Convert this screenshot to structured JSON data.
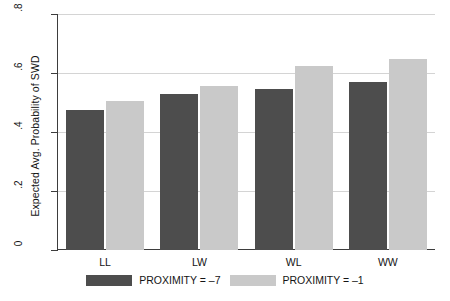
{
  "chart_data": {
    "type": "bar",
    "title": "",
    "subtitle": "",
    "xlabel": "",
    "ylabel": "Expected Avg. Probability of SWD",
    "categories": [
      "LL",
      "LW",
      "WL",
      "WW"
    ],
    "series": [
      {
        "name": "PROXIMITY = –7",
        "color": "#4d4d4d",
        "values": [
          0.475,
          0.53,
          0.545,
          0.57
        ]
      },
      {
        "name": "PROXIMITY = –1",
        "color": "#c9c9c9",
        "values": [
          0.505,
          0.555,
          0.625,
          0.648
        ]
      }
    ],
    "ylim": [
      0,
      0.8
    ],
    "yticks": [
      0,
      0.2,
      0.4,
      0.6,
      0.8
    ],
    "ytick_labels": [
      "0",
      ".2",
      ".4",
      ".6",
      ".8"
    ],
    "grid": "horizontal",
    "legend_position": "bottom-center",
    "grid_color": "#d4d4d4",
    "axis_color": "#3d3d3d",
    "background": "#ffffff"
  },
  "legend": {
    "items": [
      {
        "label": "PROXIMITY = –7",
        "color": "#4d4d4d"
      },
      {
        "label": "PROXIMITY = –1",
        "color": "#c9c9c9"
      }
    ]
  }
}
